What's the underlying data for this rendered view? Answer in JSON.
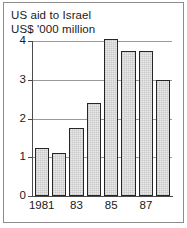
{
  "figure": {
    "title": "US aid to Israel",
    "subtitle": "US$ '000 million"
  },
  "chart_data": {
    "type": "bar",
    "title": "US aid to Israel",
    "subtitle": "US$ '000 million",
    "xlabel": "",
    "ylabel": "US$ '000 million",
    "ylim": [
      0,
      4
    ],
    "yticks": [
      0,
      1,
      2,
      3,
      4
    ],
    "ytick_labels": [
      "0",
      "1",
      "2",
      "3",
      "4"
    ],
    "grid": true,
    "legend": "none",
    "categories": [
      "1981",
      "1982",
      "1983",
      "1984",
      "1985",
      "1986",
      "1987",
      "1988"
    ],
    "xtick_labels": [
      "1981",
      "83",
      "85",
      "87"
    ],
    "xtick_categories": [
      "1981",
      "1983",
      "1985",
      "1987"
    ],
    "values": [
      1.25,
      1.1,
      1.75,
      2.4,
      4.05,
      3.75,
      3.75,
      3.0
    ],
    "bar_fill_color": "#e9e9e9",
    "bar_edge_color": "#262626"
  },
  "style": {
    "frame_color": "#8c8c8c",
    "axis_color": "#4a4a4a",
    "gridline_color": "#9a9a9a",
    "text_color": "#1a1a1a",
    "background_color": "#ffffff"
  }
}
